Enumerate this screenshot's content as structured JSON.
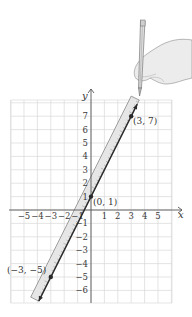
{
  "chart_data": {
    "type": "line",
    "title": "",
    "xlabel": "x",
    "ylabel": "y",
    "xlim": [
      -6,
      6
    ],
    "ylim": [
      -7,
      8
    ],
    "grid": true,
    "x_ticks": [
      -5,
      -4,
      -3,
      -2,
      -1,
      1,
      2,
      3,
      4,
      5
    ],
    "y_ticks": [
      -6,
      -5,
      -4,
      -3,
      -2,
      -1,
      1,
      2,
      3,
      4,
      5,
      6,
      7
    ],
    "x_tick_labels": [
      "−5",
      "−4",
      "−3",
      "−2",
      "−1",
      "1",
      "2",
      "3",
      "4",
      "5"
    ],
    "y_tick_labels": [
      "−6",
      "−5",
      "−4",
      "−3",
      "−2",
      "−1",
      "1",
      "2",
      "3",
      "4",
      "5",
      "6",
      "7"
    ],
    "line": {
      "slope": 2,
      "intercept": 1,
      "equation": "y = 2x + 1"
    },
    "points": [
      {
        "x": 3,
        "y": 7,
        "label": "(3, 7)"
      },
      {
        "x": 0,
        "y": 1,
        "label": "(0, 1)"
      },
      {
        "x": -3,
        "y": -5,
        "label": "(−3, −5)"
      }
    ],
    "annotations": [
      "ruler aligned along line",
      "hand holding pencil drawing line"
    ]
  },
  "axes": {
    "x_name": "x",
    "y_name": "y"
  },
  "labels": {
    "p1": "(3, 7)",
    "p2": "(0, 1)",
    "p3": "(−3, −5)"
  },
  "colors": {
    "grid": "#d9d9d9",
    "axis": "#555555",
    "line": "#2a2a2a",
    "ruler_fill": "#e6e6e6",
    "ruler_stroke": "#7a7a7a",
    "hand_fill": "#ececec",
    "hand_stroke": "#9a9a9a"
  }
}
